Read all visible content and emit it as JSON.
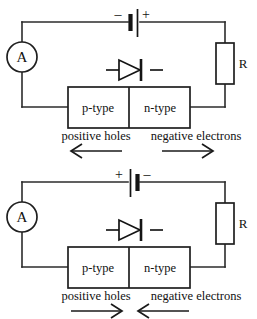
{
  "diagrams": [
    {
      "id": "forward-bias",
      "name": "forward-biased-pn-junction",
      "battery": {
        "left_sign": "–",
        "right_sign": "+"
      },
      "meter": {
        "label": "A"
      },
      "resistor": {
        "label": "R"
      },
      "semiconductor": {
        "left_region": "p-type",
        "right_region": "n-type"
      },
      "carriers": {
        "left_label": "positive holes",
        "left_arrow_direction": "left",
        "right_label": "negative electrons",
        "right_arrow_direction": "right"
      }
    },
    {
      "id": "reverse-bias",
      "name": "reverse-biased-pn-junction",
      "battery": {
        "left_sign": "+",
        "right_sign": "–"
      },
      "meter": {
        "label": "A"
      },
      "resistor": {
        "label": "R"
      },
      "semiconductor": {
        "left_region": "p-type",
        "right_region": "n-type"
      },
      "carriers": {
        "left_label": "positive holes",
        "left_arrow_direction": "right",
        "right_label": "negative electrons",
        "right_arrow_direction": "left"
      }
    }
  ],
  "colors": {
    "ink": "#1a1a1a",
    "wire": "#2b2b2b",
    "background": "#ffffff"
  }
}
